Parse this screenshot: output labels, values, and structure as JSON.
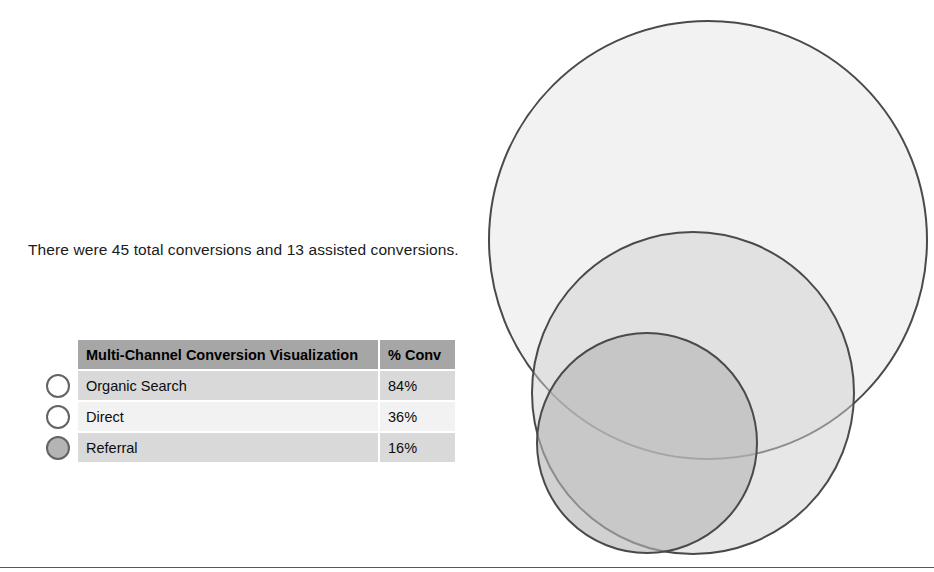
{
  "summary": {
    "text": "There were 45 total conversions and 13 assisted conversions.",
    "total_conversions": 45,
    "assisted_conversions": 13
  },
  "legend_table": {
    "header": {
      "channel_column": "Multi-Channel Conversion Visualization",
      "value_column": "% Conv"
    },
    "rows": [
      {
        "marker": "circle-outline-white",
        "channel": "Organic Search",
        "pct_conv": "84%"
      },
      {
        "marker": "circle-outline-white",
        "channel": "Direct",
        "pct_conv": "36%"
      },
      {
        "marker": "circle-outline-filled-gray",
        "channel": "Referral",
        "pct_conv": "16%"
      }
    ]
  },
  "chart_data": {
    "type": "venn",
    "title": "Multi-Channel Conversion Visualization",
    "legend_position": "left",
    "grid": false,
    "categories": [
      "Organic Search",
      "Direct",
      "Referral"
    ],
    "values": [
      84,
      36,
      16
    ],
    "value_unit": "% Conv",
    "series": [
      {
        "name": "% Conv",
        "values": [
          84,
          36,
          16
        ]
      }
    ],
    "annotations": [
      "There were 45 total conversions and 13 assisted conversions."
    ],
    "circles": [
      {
        "label": "Organic Search",
        "value": 84,
        "cx": 238,
        "cy": 240,
        "r": 219,
        "fill": "#e8e8e8",
        "fill_opacity": 0.55,
        "stroke": "#4a4a4a"
      },
      {
        "label": "Direct",
        "value": 36,
        "cx": 223,
        "cy": 393,
        "r": 161,
        "fill": "#d0d0d0",
        "fill_opacity": 0.5,
        "stroke": "#4a4a4a"
      },
      {
        "label": "Referral",
        "value": 16,
        "cx": 177,
        "cy": 443,
        "r": 110,
        "fill": "#b4b4b4",
        "fill_opacity": 0.62,
        "stroke": "#4a4a4a"
      }
    ]
  },
  "colors": {
    "header_gray": "#a6a6a6",
    "band_dark": "#d9d9d9",
    "band_light": "#f2f2f2",
    "circle_stroke": "#4a4a4a",
    "marker_stroke": "#636363",
    "marker_fill_filled": "#b4b4b4",
    "marker_fill_empty": "#ffffff",
    "rule": "#575757",
    "background": "#ffffff"
  }
}
